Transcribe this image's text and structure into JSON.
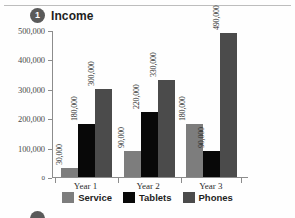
{
  "section": {
    "badge_number": "1",
    "title": "Income"
  },
  "legend": {
    "items": [
      {
        "label": "Service",
        "color": "#7d7d7d",
        "key": "service"
      },
      {
        "label": "Tablets",
        "color": "#080808",
        "key": "tablets"
      },
      {
        "label": "Phones",
        "color": "#4b4b4b",
        "key": "phones"
      }
    ]
  },
  "axis": {
    "y_ticks": [
      "0",
      "100,000",
      "200,000",
      "300,000",
      "400,000",
      "500,000"
    ],
    "x_categories": [
      "Year 1",
      "Year 2",
      "Year 3"
    ]
  },
  "chart_data": {
    "type": "bar",
    "title": "Income",
    "xlabel": "",
    "ylabel": "",
    "ylim": [
      0,
      500000
    ],
    "ytick_values": [
      0,
      100000,
      200000,
      300000,
      400000,
      500000
    ],
    "ytick_labels": [
      "0",
      "100,000",
      "200,000",
      "300,000",
      "400,000",
      "500,000"
    ],
    "categories": [
      "Year 1",
      "Year 2",
      "Year 3"
    ],
    "grid": false,
    "legend_position": "bottom",
    "series": [
      {
        "name": "Service",
        "color": "#7d7d7d",
        "values": [
          30000,
          90000,
          180000
        ],
        "labels": [
          "30,000",
          "90,000",
          "180,000"
        ]
      },
      {
        "name": "Tablets",
        "color": "#080808",
        "values": [
          180000,
          220000,
          90000
        ],
        "labels": [
          "180,000",
          "220,000",
          "90,000"
        ]
      },
      {
        "name": "Phones",
        "color": "#4b4b4b",
        "values": [
          300000,
          330000,
          490000
        ],
        "labels": [
          "300,000",
          "330,000",
          "490,000"
        ]
      }
    ]
  }
}
